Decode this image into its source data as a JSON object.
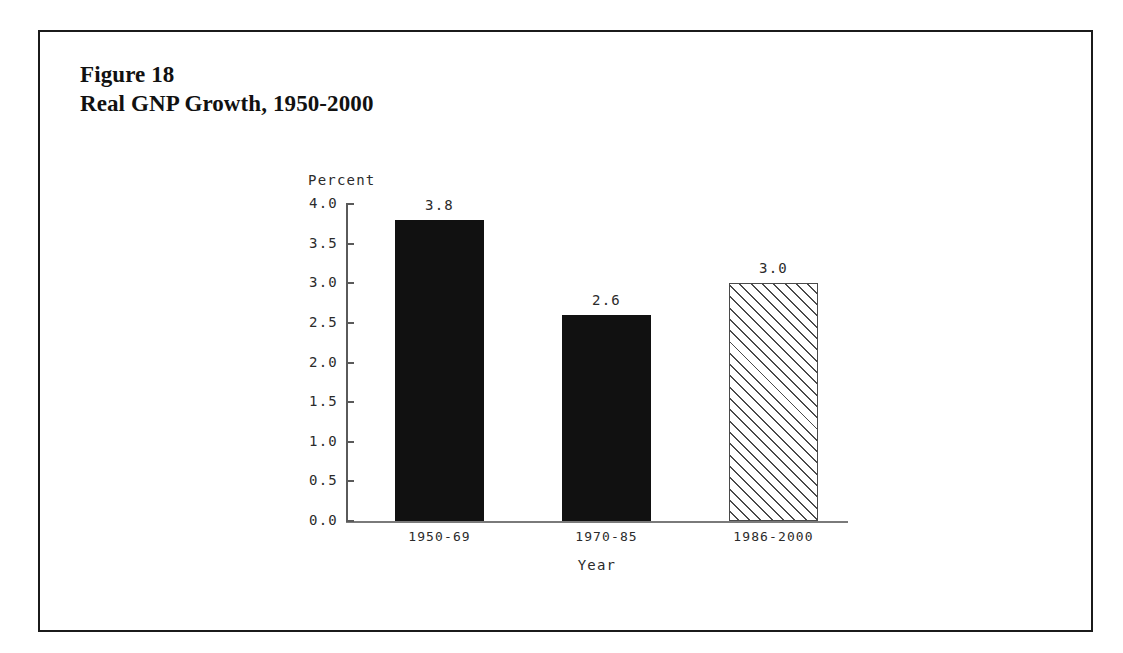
{
  "figure": {
    "title_line1": "Figure 18",
    "title_line2": "Real GNP Growth, 1950-2000"
  },
  "chart_data": {
    "type": "bar",
    "title": "Real GNP Growth, 1950-2000",
    "subtitle": "Figure 18",
    "categories": [
      "1950-69",
      "1970-85",
      "1986-2000"
    ],
    "values": [
      3.8,
      2.6,
      3.0
    ],
    "value_labels": [
      "3.8",
      "2.6",
      "3.0"
    ],
    "series": [
      {
        "name": "Real GNP Growth",
        "values": [
          3.8,
          2.6,
          3.0
        ]
      }
    ],
    "bar_styles": [
      "solid-black",
      "solid-black",
      "diagonal-hatch"
    ],
    "xlabel": "Year",
    "ylabel": "Percent",
    "ylim": [
      0.0,
      4.0
    ],
    "ytick_labels": [
      "4.0",
      "3.5",
      "3.0",
      "2.5",
      "2.0",
      "1.5",
      "1.0",
      "0.5",
      "0.0"
    ],
    "ytick_values": [
      4.0,
      3.5,
      3.0,
      2.5,
      2.0,
      1.5,
      1.0,
      0.5,
      0.0
    ],
    "grid": false,
    "legend": "none",
    "colors": {
      "bar_solid": "#111111",
      "bar_hatch_line": "#4a4a4a",
      "axis": "#5a5a5a",
      "text": "#2b2b2b",
      "frame": "#1b1b1b",
      "background": "#ffffff"
    }
  }
}
